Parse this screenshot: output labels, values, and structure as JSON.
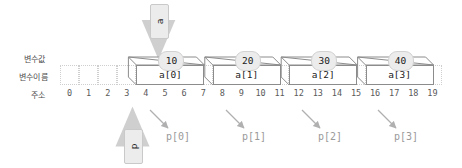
{
  "diagram": {
    "title_labels": {
      "variable_value": "변수값",
      "variable_name": "변수이름",
      "address": "주소"
    },
    "addresses": [
      "0",
      "1",
      "2",
      "3",
      "4",
      "5",
      "6",
      "7",
      "8",
      "9",
      "10",
      "11",
      "12",
      "13",
      "14",
      "15",
      "16",
      "17",
      "18",
      "19"
    ],
    "array_cells": [
      {
        "name": "a[0]",
        "value": "10",
        "start_address": 4,
        "pointer_label": "p[0]"
      },
      {
        "name": "a[1]",
        "value": "20",
        "start_address": 8,
        "pointer_label": "p[1]"
      },
      {
        "name": "a[2]",
        "value": "30",
        "start_address": 12,
        "pointer_label": "p[2]"
      },
      {
        "name": "a[3]",
        "value": "40",
        "start_address": 16,
        "pointer_label": "p[3]"
      }
    ],
    "array_pointer": {
      "label": "a",
      "points_to_address": 4
    },
    "variable_pointer": {
      "label": "p",
      "points_to_address": 4
    },
    "colors": {
      "box_fill": "#ececec",
      "box_stroke": "#c9c9c9",
      "cell_stroke": "#8c8c8c",
      "grid_stroke": "#cfcfcf",
      "arrow": "#b0b0b0",
      "label_text": "#9a9a9a",
      "side_label_text": "#4d4d4d"
    }
  }
}
